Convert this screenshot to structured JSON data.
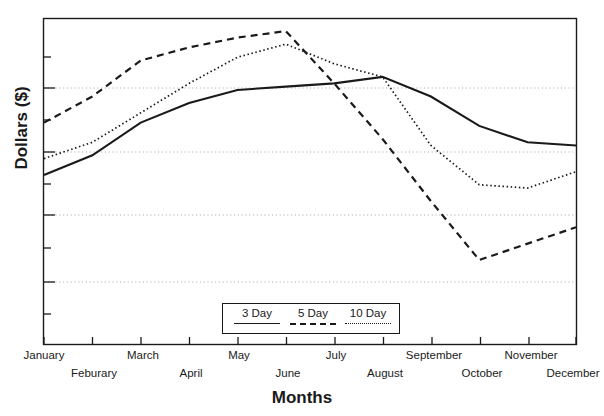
{
  "chart_data": {
    "type": "line",
    "title": "",
    "xlabel": "Months",
    "ylabel": "Dollars ($)",
    "categories": [
      "January",
      "Feburary",
      "March",
      "April",
      "May",
      "June",
      "July",
      "August",
      "September",
      "October",
      "November",
      "December"
    ],
    "grid": true,
    "grid_axis": "y",
    "ylim": [
      0,
      100
    ],
    "y_tick_labels": [],
    "y_major_gridlines": [
      25,
      45,
      65,
      85
    ],
    "legend_position": "bottom-center",
    "series": [
      {
        "name": "3 Day",
        "style": "solid",
        "color": "#1a1a1a",
        "values": [
          52,
          58,
          68,
          74,
          78,
          79,
          80,
          82,
          76,
          67,
          62,
          61
        ]
      },
      {
        "name": "5 Day",
        "style": "dashed",
        "color": "#1a1a1a",
        "values": [
          68,
          76,
          87,
          91,
          94,
          96,
          80,
          63,
          44,
          26,
          31,
          36
        ]
      },
      {
        "name": "10 Day",
        "style": "dotted",
        "color": "#1a1a1a",
        "values": [
          57,
          62,
          71,
          80,
          88,
          92,
          86,
          82,
          61,
          49,
          48,
          53
        ]
      }
    ]
  },
  "axis": {
    "xlabel": "Months",
    "ylabel": "Dollars ($)",
    "xticks": [
      "January",
      "Feburary",
      "March",
      "April",
      "May",
      "June",
      "July",
      "August",
      "September",
      "October",
      "November",
      "December"
    ]
  },
  "legend": {
    "entries": [
      {
        "label": "3 Day",
        "style": "solid"
      },
      {
        "label": "5 Day",
        "style": "dashed"
      },
      {
        "label": "10 Day",
        "style": "dotted"
      }
    ]
  },
  "colors": {
    "ink": "#1a1a1a",
    "grid": "#b4b4b4",
    "background": "#ffffff"
  }
}
